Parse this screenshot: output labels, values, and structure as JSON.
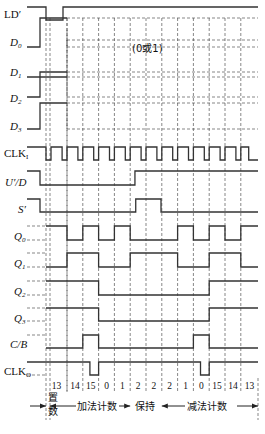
{
  "diagram": {
    "type": "timing-diagram",
    "signals": [
      {
        "id": "LD",
        "label": "LD",
        "suffix": "′",
        "italic": false
      },
      {
        "id": "D0",
        "label": "D",
        "sub": "0",
        "italic": true
      },
      {
        "id": "D1",
        "label": "D",
        "sub": "1",
        "italic": true
      },
      {
        "id": "D2",
        "label": "D",
        "sub": "2",
        "italic": true
      },
      {
        "id": "D3",
        "label": "D",
        "sub": "3",
        "italic": true
      },
      {
        "id": "CLKI",
        "label": "CLK",
        "sub": "I",
        "italic": false
      },
      {
        "id": "UD",
        "label": "U′/D",
        "italic": true
      },
      {
        "id": "S",
        "label": "S′",
        "italic": true
      },
      {
        "id": "Q0",
        "label": "Q",
        "sub": "0",
        "italic": true
      },
      {
        "id": "Q1",
        "label": "Q",
        "sub": "1",
        "italic": true
      },
      {
        "id": "Q2",
        "label": "Q",
        "sub": "2",
        "italic": true
      },
      {
        "id": "Q3",
        "label": "Q",
        "sub": "3",
        "italic": true
      },
      {
        "id": "CB",
        "label": "C/B",
        "italic": true
      },
      {
        "id": "CLKO",
        "label": "CLK",
        "sub": "O",
        "italic": false
      }
    ],
    "dont_care_note": "(0或1)",
    "states": [
      "13",
      "14",
      "15",
      "0",
      "1",
      "2",
      "2",
      "2",
      "1",
      "0",
      "15",
      "14",
      "13"
    ],
    "phases": [
      {
        "name": "置数",
        "line1": "置",
        "line2": "数"
      },
      {
        "name": "加法计数"
      },
      {
        "name": "保持"
      },
      {
        "name": "减法计数"
      }
    ],
    "waveforms": {
      "LD": [
        1,
        0,
        1,
        1,
        1,
        1,
        1,
        1,
        1,
        1,
        1,
        1,
        1
      ],
      "D0": [
        1
      ],
      "D1": [
        0
      ],
      "D2": [
        1
      ],
      "D3": [
        1
      ],
      "UD": [
        0,
        0,
        0,
        0,
        0,
        1,
        1,
        1,
        1,
        1,
        1,
        1,
        1
      ],
      "S": [
        1,
        1,
        1,
        1,
        1,
        0,
        0,
        1,
        1,
        1,
        1,
        1,
        1
      ],
      "Q0": [
        1,
        0,
        1,
        0,
        1,
        0,
        0,
        0,
        1,
        0,
        1,
        0,
        1
      ],
      "Q1": [
        0,
        1,
        1,
        0,
        0,
        1,
        1,
        1,
        0,
        0,
        1,
        1,
        0
      ],
      "Q2": [
        1,
        1,
        1,
        0,
        0,
        0,
        0,
        0,
        0,
        0,
        1,
        1,
        1
      ],
      "Q3": [
        1,
        1,
        1,
        0,
        0,
        0,
        0,
        0,
        0,
        0,
        1,
        1,
        1
      ],
      "CB": [
        0,
        0,
        1,
        0,
        0,
        0,
        0,
        0,
        0,
        1,
        0,
        0,
        0
      ],
      "CLKO": [
        1,
        1,
        0,
        1,
        1,
        1,
        1,
        1,
        1,
        0,
        1,
        1,
        1
      ]
    }
  }
}
